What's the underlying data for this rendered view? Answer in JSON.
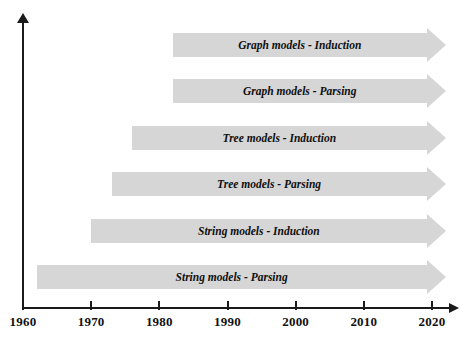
{
  "chart_data": {
    "type": "bar",
    "title": "",
    "subtitle": "",
    "xlabel": "",
    "ylabel": "",
    "orientation": "horizontal",
    "grid": false,
    "legend": null,
    "xlim": [
      1960,
      2020
    ],
    "x_ticks": [
      1960,
      1970,
      1980,
      1990,
      2000,
      2010,
      2020
    ],
    "x_tick_labels": [
      "1960",
      "1970",
      "1980",
      "1990",
      "2000",
      "2010",
      "2020"
    ],
    "categories": [
      "Graph models - Induction",
      "Graph models - Parsing",
      "Tree models - Induction",
      "Tree models - Parsing",
      "String models - Induction",
      "String models - Parsing"
    ],
    "bars": [
      {
        "label": "Graph models - Induction",
        "start": 1982,
        "end": 2022,
        "open_ended": true
      },
      {
        "label": "Graph models - Parsing",
        "start": 1982,
        "end": 2022,
        "open_ended": true
      },
      {
        "label": "Tree models - Induction",
        "start": 1976,
        "end": 2022,
        "open_ended": true
      },
      {
        "label": "Tree models - Parsing",
        "start": 1973,
        "end": 2022,
        "open_ended": true
      },
      {
        "label": "String models - Induction",
        "start": 1970,
        "end": 2022,
        "open_ended": true
      },
      {
        "label": "String models - Parsing",
        "start": 1962,
        "end": 2022,
        "open_ended": true
      }
    ],
    "values": [
      40,
      40,
      46,
      49,
      52,
      60
    ],
    "colors": {
      "bar_fill": "#d6d6d6",
      "axis": "#1a1a1a",
      "label_text": "#0f0f0f",
      "background": "#ffffff"
    }
  }
}
